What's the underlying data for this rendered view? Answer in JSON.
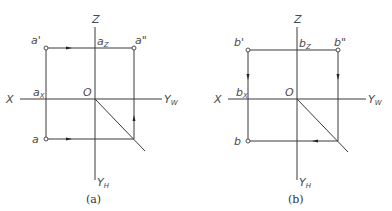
{
  "figures": [
    {
      "id": "a",
      "caption": "(a)",
      "axes": {
        "z": "Z",
        "x": "X",
        "yw": "Y",
        "yw_sub": "W",
        "yh": "Y",
        "yh_sub": "H",
        "origin": "O"
      },
      "points": {
        "front": "a'",
        "side": "a\"",
        "top": "a",
        "x_mark": "a",
        "x_mark_sub": "X",
        "z_mark": "a",
        "z_mark_sub": "Z"
      },
      "arrows": [
        "front-view horizontal (rightward)",
        "top-view horizontal (rightward)",
        "side vertical (upward)"
      ]
    },
    {
      "id": "b",
      "caption": "(b)",
      "axes": {
        "z": "Z",
        "x": "X",
        "yw": "Y",
        "yw_sub": "W",
        "yh": "Y",
        "yh_sub": "H",
        "origin": "O"
      },
      "points": {
        "front": "b'",
        "side": "b\"",
        "top": "b",
        "x_mark": "b",
        "x_mark_sub": "X",
        "z_mark": "b",
        "z_mark_sub": "Z"
      },
      "arrows": [
        "front-view vertical (downward)",
        "side-view vertical (downward)",
        "top-view horizontal (leftward)"
      ]
    }
  ]
}
